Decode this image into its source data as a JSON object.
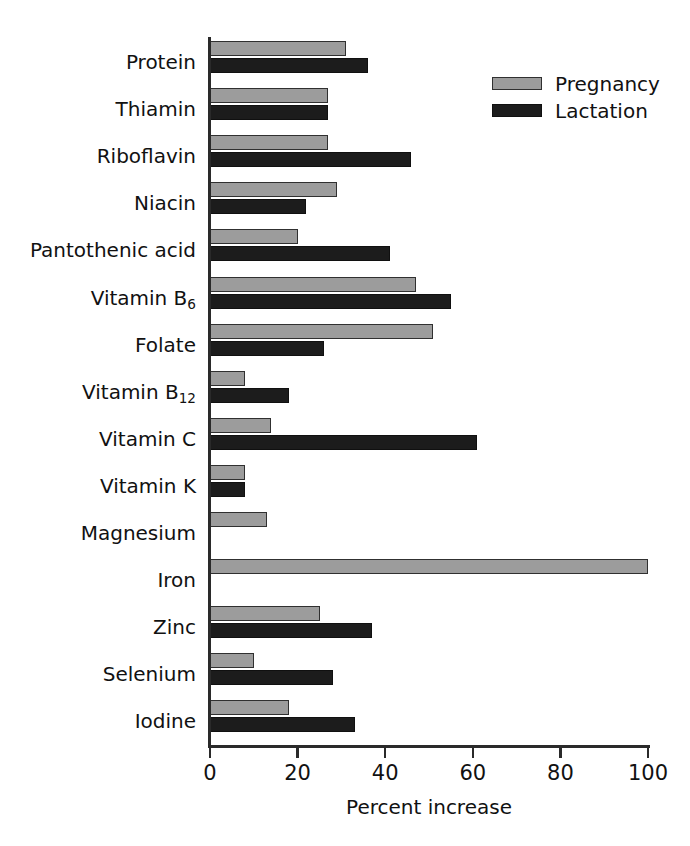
{
  "chart_data": {
    "type": "bar",
    "orientation": "horizontal",
    "title": "",
    "xlabel": "Percent increase",
    "ylabel": "",
    "xlim": [
      0,
      100
    ],
    "xticks": [
      0,
      20,
      40,
      60,
      80,
      100
    ],
    "xtick_labels": [
      "0",
      "20",
      "40",
      "60",
      "80",
      "100"
    ],
    "grid": false,
    "legend_position": "top-right",
    "categories": [
      "Protein",
      "Thiamin",
      "Riboflavin",
      "Niacin",
      "Pantothenic acid",
      "Vitamin B6",
      "Folate",
      "Vitamin B12",
      "Vitamin C",
      "Vitamin K",
      "Magnesium",
      "Iron",
      "Zinc",
      "Selenium",
      "Iodine"
    ],
    "series": [
      {
        "name": "Pregnancy",
        "color": "#9c9c9c",
        "values": [
          31,
          27,
          27,
          29,
          20,
          47,
          51,
          8,
          14,
          8,
          13,
          100,
          25,
          10,
          18
        ]
      },
      {
        "name": "Lactation",
        "color": "#1c1c1c",
        "values": [
          36,
          27,
          46,
          22,
          41,
          55,
          26,
          18,
          61,
          8,
          0,
          0,
          37,
          28,
          33
        ]
      }
    ]
  },
  "rows": [
    {
      "label": "Protein",
      "sub": "",
      "pregnancy": 31,
      "lactation": 36
    },
    {
      "label": "Thiamin",
      "sub": "",
      "pregnancy": 27,
      "lactation": 27
    },
    {
      "label": "Riboflavin",
      "sub": "",
      "pregnancy": 27,
      "lactation": 46
    },
    {
      "label": "Niacin",
      "sub": "",
      "pregnancy": 29,
      "lactation": 22
    },
    {
      "label": "Pantothenic acid",
      "sub": "",
      "pregnancy": 20,
      "lactation": 41
    },
    {
      "label": "Vitamin B",
      "sub": "6",
      "pregnancy": 47,
      "lactation": 55
    },
    {
      "label": "Folate",
      "sub": "",
      "pregnancy": 51,
      "lactation": 26
    },
    {
      "label": "Vitamin B",
      "sub": "12",
      "pregnancy": 8,
      "lactation": 18
    },
    {
      "label": "Vitamin C",
      "sub": "",
      "pregnancy": 14,
      "lactation": 61
    },
    {
      "label": "Vitamin K",
      "sub": "",
      "pregnancy": 8,
      "lactation": 8
    },
    {
      "label": "Magnesium",
      "sub": "",
      "pregnancy": 13,
      "lactation": 0
    },
    {
      "label": "Iron",
      "sub": "",
      "pregnancy": 100,
      "lactation": 0
    },
    {
      "label": "Zinc",
      "sub": "",
      "pregnancy": 25,
      "lactation": 37
    },
    {
      "label": "Selenium",
      "sub": "",
      "pregnancy": 10,
      "lactation": 28
    },
    {
      "label": "Iodine",
      "sub": "",
      "pregnancy": 18,
      "lactation": 33
    }
  ],
  "axis": {
    "x_title": "Percent increase",
    "ticks": [
      "0",
      "20",
      "40",
      "60",
      "80",
      "100"
    ]
  },
  "legend": {
    "items": [
      {
        "label": "Pregnancy",
        "swatch": "pregnancy-swatch"
      },
      {
        "label": "Lactation",
        "swatch": "lactation-swatch"
      }
    ]
  },
  "colors": {
    "pregnancy_fill": "#9c9c9c",
    "lactation_fill": "#1c1c1c",
    "axis": "#2a2a2a",
    "text": "#111111",
    "background": "#ffffff"
  }
}
